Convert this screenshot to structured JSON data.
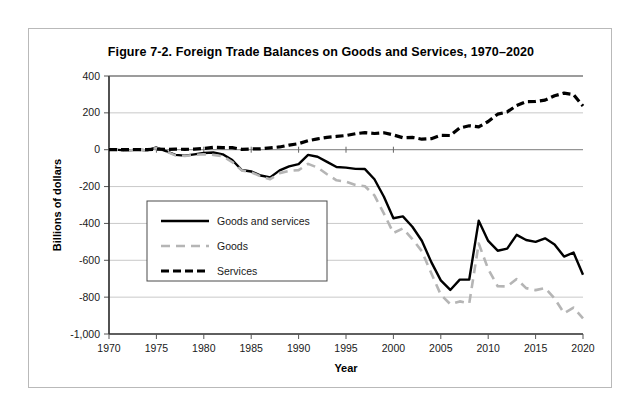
{
  "figure": {
    "title": "Figure 7-2. Foreign Trade Balances on Goods and Services, 1970–2020"
  },
  "chart_data": {
    "type": "line",
    "title": "Figure 7-2. Foreign Trade Balances on Goods and Services, 1970–2020",
    "xlabel": "Year",
    "ylabel": "Billions of dollars",
    "xlim": [
      1970,
      2020
    ],
    "ylim": [
      -1000,
      400
    ],
    "xticks": [
      1970,
      1975,
      1980,
      1985,
      1990,
      1995,
      2000,
      2005,
      2010,
      2015,
      2020
    ],
    "xtick_labels": [
      "1970",
      "1975",
      "1980",
      "1985",
      "1990",
      "1995",
      "2000",
      "2005",
      "2010",
      "2015",
      "2020"
    ],
    "yticks": [
      400,
      200,
      0,
      -200,
      -400,
      -600,
      -800,
      -1000
    ],
    "ytick_labels": [
      "400",
      "200",
      "0",
      "-200",
      "-400",
      "-600",
      "-800",
      "-1,000"
    ],
    "grid": "horizontal",
    "legend_position": "center-left",
    "x": [
      1970,
      1971,
      1972,
      1973,
      1974,
      1975,
      1976,
      1977,
      1978,
      1979,
      1980,
      1981,
      1982,
      1983,
      1984,
      1985,
      1986,
      1987,
      1988,
      1989,
      1990,
      1991,
      1992,
      1993,
      1994,
      1995,
      1996,
      1997,
      1998,
      1999,
      2000,
      2001,
      2002,
      2003,
      2004,
      2005,
      2006,
      2007,
      2008,
      2009,
      2010,
      2011,
      2012,
      2013,
      2014,
      2015,
      2016,
      2017,
      2018,
      2019,
      2020
    ],
    "series": [
      {
        "name": "Goods and services",
        "style": "solid",
        "color": "#000000",
        "values": [
          2,
          -1,
          -5,
          2,
          -4,
          12,
          -7,
          -28,
          -32,
          -25,
          -18,
          -15,
          -25,
          -56,
          -110,
          -118,
          -140,
          -150,
          -112,
          -90,
          -78,
          -28,
          -38,
          -66,
          -94,
          -97,
          -104,
          -105,
          -160,
          -255,
          -372,
          -362,
          -418,
          -494,
          -610,
          -709,
          -761,
          -705,
          -704,
          -385,
          -495,
          -548,
          -537,
          -462,
          -490,
          -500,
          -481,
          -514,
          -580,
          -558,
          -678
        ]
      },
      {
        "name": "Goods",
        "style": "dashed",
        "color": "#b5b5b5",
        "values": [
          3,
          -2,
          -6,
          1,
          -5,
          9,
          -9,
          -31,
          -34,
          -28,
          -25,
          -28,
          -36,
          -67,
          -112,
          -122,
          -145,
          -160,
          -127,
          -115,
          -111,
          -77,
          -97,
          -133,
          -166,
          -174,
          -191,
          -198,
          -248,
          -347,
          -452,
          -427,
          -485,
          -551,
          -670,
          -787,
          -838,
          -823,
          -834,
          -509,
          -648,
          -741,
          -742,
          -702,
          -751,
          -762,
          -750,
          -807,
          -887,
          -857,
          -915
        ]
      },
      {
        "name": "Services",
        "style": "dotted-dash",
        "color": "#000000",
        "values": [
          0,
          1,
          1,
          1,
          1,
          3,
          2,
          3,
          2,
          3,
          7,
          13,
          11,
          11,
          2,
          4,
          5,
          10,
          15,
          25,
          33,
          49,
          59,
          67,
          72,
          77,
          87,
          93,
          88,
          92,
          80,
          65,
          67,
          57,
          60,
          78,
          77,
          118,
          130,
          124,
          153,
          193,
          205,
          240,
          261,
          262,
          269,
          293,
          307,
          299,
          237
        ]
      }
    ]
  },
  "legend": {
    "items": [
      {
        "label": "Goods and services"
      },
      {
        "label": "Goods"
      },
      {
        "label": "Services"
      }
    ]
  }
}
